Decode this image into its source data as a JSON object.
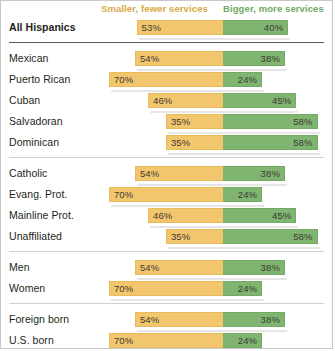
{
  "header": {
    "left_label": "Smaller, fewer services",
    "right_label": "Bigger, more services",
    "left_color": "#d9a93f",
    "right_color": "#71a862"
  },
  "colors": {
    "bar_left": "#f2c66d",
    "bar_right": "#80b571",
    "text": "#231f20",
    "divider": "#d0d0d0",
    "divider_strong": "#58595b"
  },
  "chart_data": {
    "type": "bar",
    "title": "",
    "subtype": "diverging-stacked",
    "xlabel": "",
    "ylabel": "",
    "grid": false,
    "legend_position": "top",
    "series": [
      {
        "name": "Smaller, fewer services",
        "color": "#f2c66d",
        "side": "left"
      },
      {
        "name": "Bigger, more services",
        "color": "#80b571",
        "side": "right"
      }
    ],
    "categories": [
      "All Hispanics",
      "Mexican",
      "Puerto Rican",
      "Cuban",
      "Salvadoran",
      "Dominican",
      "Catholic",
      "Evang. Prot.",
      "Mainline Prot.",
      "Unaffiliated",
      "Men",
      "Women",
      "Foreign born",
      "U.S. born",
      "General public"
    ],
    "left_values": [
      53,
      54,
      70,
      46,
      35,
      35,
      54,
      70,
      46,
      35,
      54,
      70,
      54,
      70,
      40
    ],
    "right_values": [
      40,
      38,
      24,
      45,
      58,
      58,
      38,
      24,
      45,
      58,
      38,
      24,
      38,
      24,
      54
    ]
  },
  "rows": [
    {
      "label": "All Hispanics",
      "left": 53,
      "right": 40,
      "left_text": "53%",
      "right_text": "40%",
      "bold": true
    },
    {
      "label": "Mexican",
      "left": 54,
      "right": 38,
      "left_text": "54%",
      "right_text": "38%",
      "bold": false
    },
    {
      "label": "Puerto Rican",
      "left": 70,
      "right": 24,
      "left_text": "70%",
      "right_text": "24%",
      "bold": false
    },
    {
      "label": "Cuban",
      "left": 46,
      "right": 45,
      "left_text": "46%",
      "right_text": "45%",
      "bold": false
    },
    {
      "label": "Salvadoran",
      "left": 35,
      "right": 58,
      "left_text": "35%",
      "right_text": "58%",
      "bold": false
    },
    {
      "label": "Dominican",
      "left": 35,
      "right": 58,
      "left_text": "35%",
      "right_text": "58%",
      "bold": false
    },
    {
      "label": "Catholic",
      "left": 54,
      "right": 38,
      "left_text": "54%",
      "right_text": "38%",
      "bold": false
    },
    {
      "label": "Evang. Prot.",
      "left": 70,
      "right": 24,
      "left_text": "70%",
      "right_text": "24%",
      "bold": false
    },
    {
      "label": "Mainline Prot.",
      "left": 46,
      "right": 45,
      "left_text": "46%",
      "right_text": "45%",
      "bold": false
    },
    {
      "label": "Unaffiliated",
      "left": 35,
      "right": 58,
      "left_text": "35%",
      "right_text": "58%",
      "bold": false
    },
    {
      "label": "Men",
      "left": 54,
      "right": 38,
      "left_text": "54%",
      "right_text": "38%",
      "bold": false
    },
    {
      "label": "Women",
      "left": 70,
      "right": 24,
      "left_text": "70%",
      "right_text": "24%",
      "bold": false
    },
    {
      "label": "Foreign born",
      "left": 54,
      "right": 38,
      "left_text": "54%",
      "right_text": "38%",
      "bold": false
    },
    {
      "label": "U.S. born",
      "left": 70,
      "right": 24,
      "left_text": "70%",
      "right_text": "24%",
      "bold": false
    },
    {
      "label": "General public",
      "left": 40,
      "right": 54,
      "left_text": "40%",
      "right_text": "54%",
      "bold": true
    }
  ],
  "layout": {
    "center_x": 222,
    "px_per_pct": 1.63,
    "row_height": 21,
    "group_breaks_after": [
      0,
      5,
      9,
      11,
      13
    ],
    "strong_break_after": [
      0
    ]
  }
}
